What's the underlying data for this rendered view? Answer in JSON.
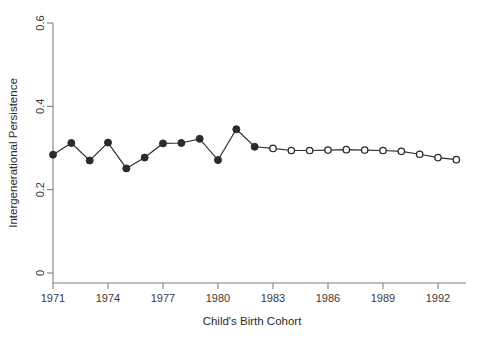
{
  "chart_data": {
    "type": "line",
    "title": "",
    "xlabel": "Child's Birth Cohort",
    "ylabel": "Intergenerational Persistence",
    "xlim": [
      1970.2,
      1993.6
    ],
    "ylim": [
      0,
      0.6
    ],
    "grid": false,
    "legend": "none",
    "xticks": [
      1971,
      1974,
      1977,
      1980,
      1983,
      1986,
      1989,
      1992
    ],
    "xtick_labels": [
      "1971",
      "1974",
      "1977",
      "1980",
      "1983",
      "1986",
      "1989",
      "1992"
    ],
    "yticks": [
      0,
      0.2,
      0.4,
      0.6
    ],
    "ytick_labels": [
      "0",
      "0.2",
      "0.4",
      "0.6"
    ],
    "series": [
      {
        "name": "Intergenerational Persistence",
        "marker_filled_through": 1982,
        "x": [
          1971,
          1972,
          1973,
          1974,
          1975,
          1976,
          1977,
          1978,
          1979,
          1980,
          1981,
          1982,
          1983,
          1984,
          1985,
          1986,
          1987,
          1988,
          1989,
          1990,
          1991,
          1992,
          1993
        ],
        "values": [
          0.284,
          0.312,
          0.27,
          0.313,
          0.251,
          0.277,
          0.311,
          0.312,
          0.322,
          0.271,
          0.345,
          0.303,
          0.299,
          0.294,
          0.294,
          0.295,
          0.296,
          0.295,
          0.294,
          0.292,
          0.285,
          0.277,
          0.272
        ]
      }
    ]
  },
  "colors": {
    "line": "#2e2e2e",
    "marker": "#2b2b2b",
    "axis": "#808080",
    "text": "#2b2b2b",
    "background": "#ffffff"
  }
}
